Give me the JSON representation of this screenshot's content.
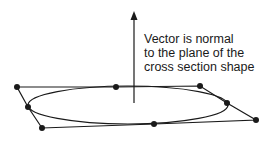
{
  "annotation": {
    "lines": [
      "Vector is normal",
      "to the plane of the",
      "cross section shape"
    ]
  },
  "colors": {
    "stroke": "#1a1a1a",
    "background": "#ffffff"
  },
  "diagram": {
    "normal_vector": {
      "x": 134,
      "y_start": 103,
      "y_end": 13
    },
    "ellipse": {
      "cx": 128,
      "cy": 105,
      "rx": 100,
      "ry": 19
    },
    "control_polygon": [
      {
        "x": 17,
        "y": 87
      },
      {
        "x": 116,
        "y": 87
      },
      {
        "x": 200,
        "y": 86
      },
      {
        "x": 227,
        "y": 103
      },
      {
        "x": 256,
        "y": 120
      },
      {
        "x": 154,
        "y": 124
      },
      {
        "x": 42,
        "y": 128
      },
      {
        "x": 28,
        "y": 107
      }
    ]
  }
}
